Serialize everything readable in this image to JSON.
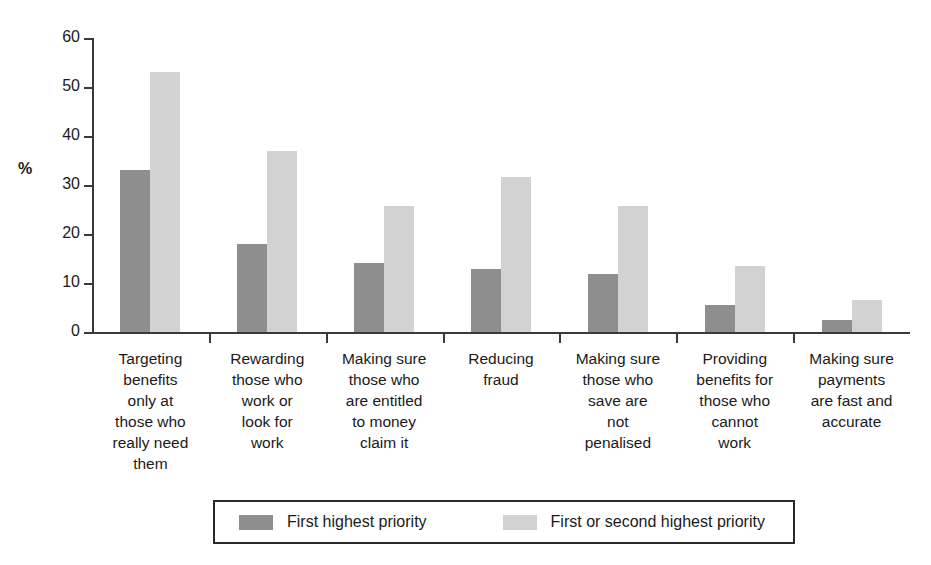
{
  "chart_data": {
    "type": "bar",
    "title": "",
    "xlabel": "",
    "ylabel": "%",
    "ylim": [
      0,
      60
    ],
    "yticks": [
      0,
      10,
      20,
      30,
      40,
      50,
      60
    ],
    "grid": false,
    "legend_position": "bottom",
    "categories": [
      "Targeting\nbenefits\nonly at\nthose who\nreally need\nthem",
      "Rewarding\nthose who\nwork or\nlook for\nwork",
      "Making sure\nthose who\nare entitled\nto money\nclaim it",
      "Reducing\nfraud",
      "Making sure\nthose who\nsave are\nnot\npenalised",
      "Providing\nbenefits for\nthose who\ncannot\nwork",
      "Making sure\npayments\nare fast and\naccurate"
    ],
    "series": [
      {
        "name": "First highest priority",
        "color": "#8e8e8e",
        "values": [
          33,
          18,
          14,
          12.8,
          11.8,
          5.6,
          2.5
        ]
      },
      {
        "name": "First or second highest priority",
        "color": "#d2d2d2",
        "values": [
          53,
          37,
          25.7,
          31.7,
          25.7,
          13.5,
          6.6
        ]
      }
    ]
  },
  "axis": {
    "y_title": "%",
    "tick_labels": [
      "60",
      "50",
      "40",
      "30",
      "20",
      "10",
      "0"
    ]
  },
  "legend": {
    "entries": [
      {
        "label": "First highest priority",
        "color": "#8e8e8e"
      },
      {
        "label": "First or second highest priority",
        "color": "#d2d2d2"
      }
    ]
  }
}
